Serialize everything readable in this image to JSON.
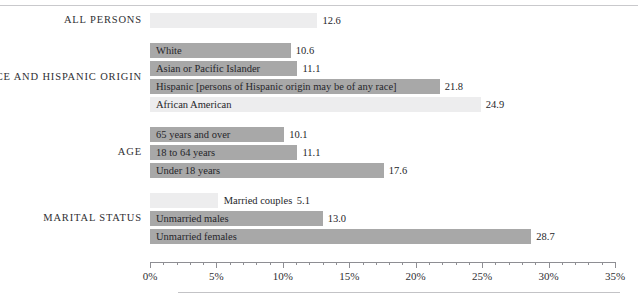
{
  "chart_data": {
    "type": "bar",
    "orientation": "horizontal",
    "title": "",
    "subtitle": "",
    "xlabel": "",
    "ylabel": "",
    "xlim": [
      0,
      35
    ],
    "xticks": [
      0,
      5,
      10,
      15,
      20,
      25,
      30,
      35
    ],
    "xtick_labels": [
      "0%",
      "5%",
      "10%",
      "15%",
      "20%",
      "25%",
      "30%",
      "35%"
    ],
    "minor_tick_step": 1,
    "grid": false,
    "legend": "none",
    "value_suffix": "",
    "colors": {
      "bar_dark": "#a8a8a8",
      "bar_light": "#ededee",
      "axis": "#8e8e93",
      "text": "#26262a",
      "rule": "#c9c9cc"
    },
    "groups": [
      {
        "label": "ALL PERSONS",
        "bars": [
          {
            "label": "",
            "value": 12.6,
            "value_text": "12.6",
            "shade": "light",
            "label_position": "none"
          }
        ]
      },
      {
        "label": "RACE AND HISPANIC ORIGIN",
        "bars": [
          {
            "label": "White",
            "value": 10.6,
            "value_text": "10.6",
            "shade": "dark",
            "label_position": "inside"
          },
          {
            "label": "Asian or Pacific Islander",
            "value": 11.1,
            "value_text": "11.1",
            "shade": "dark",
            "label_position": "inside"
          },
          {
            "label": "Hispanic [persons of Hispanic origin may be of any race]",
            "value": 21.8,
            "value_text": "21.8",
            "shade": "dark",
            "label_position": "inside"
          },
          {
            "label": "African American",
            "value": 24.9,
            "value_text": "24.9",
            "shade": "light",
            "label_position": "inside"
          }
        ]
      },
      {
        "label": "AGE",
        "bars": [
          {
            "label": "65 years and over",
            "value": 10.1,
            "value_text": "10.1",
            "shade": "dark",
            "label_position": "inside"
          },
          {
            "label": "18 to 64 years",
            "value": 11.1,
            "value_text": "11.1",
            "shade": "dark",
            "label_position": "inside"
          },
          {
            "label": "Under 18 years",
            "value": 17.6,
            "value_text": "17.6",
            "shade": "dark",
            "label_position": "inside"
          }
        ]
      },
      {
        "label": "MARITAL STATUS",
        "bars": [
          {
            "label": "Married couples",
            "value": 5.1,
            "value_text": "5.1",
            "shade": "light",
            "label_position": "outside"
          },
          {
            "label": "Unmarried males",
            "value": 13.0,
            "value_text": "13.0",
            "shade": "dark",
            "label_position": "inside"
          },
          {
            "label": "Unmarried females",
            "value": 28.7,
            "value_text": "28.7",
            "shade": "dark",
            "label_position": "inside"
          }
        ]
      }
    ]
  }
}
